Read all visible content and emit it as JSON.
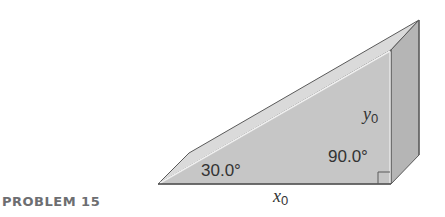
{
  "problem": {
    "label": "PROBLEM 15"
  },
  "figure": {
    "shape": "right-triangular wedge (prism)",
    "angles": {
      "left": "30.0°",
      "right": "90.0°"
    },
    "base_label": {
      "var": "x",
      "sub": "0"
    },
    "height_label": {
      "var": "y",
      "sub": "0"
    },
    "colors": {
      "front_face": "#c4c4c4",
      "slope_face": "#dadada",
      "side_face": "#b3b3b3",
      "edge": "#5a5a5a",
      "highlight": "#f0f0f0"
    }
  }
}
